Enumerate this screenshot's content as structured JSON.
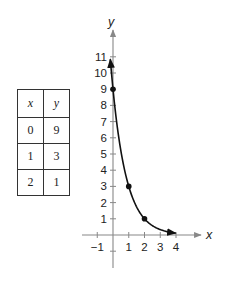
{
  "table": {
    "headers": [
      "x",
      "y"
    ],
    "rows": [
      [
        "0",
        "9"
      ],
      [
        "1",
        "3"
      ],
      [
        "2",
        "1"
      ]
    ]
  },
  "chart_data": {
    "type": "line",
    "title": "",
    "function": "y = 9(1/3)^x",
    "xlabel": "x",
    "ylabel": "y",
    "xlim": [
      -1.9,
      5.5
    ],
    "ylim": [
      -2,
      12
    ],
    "x_ticks": [
      -1,
      1,
      2,
      3,
      4
    ],
    "y_ticks": [
      1,
      2,
      3,
      4,
      5,
      6,
      7,
      8,
      9,
      10,
      11
    ],
    "grid": false,
    "points": [
      {
        "x": 0,
        "y": 9
      },
      {
        "x": 1,
        "y": 3
      },
      {
        "x": 2,
        "y": 1
      }
    ],
    "series": [
      {
        "name": "curve",
        "x": [
          -0.18,
          0,
          0.5,
          1,
          1.5,
          2,
          2.5,
          3,
          3.5,
          4
        ],
        "values": [
          11.7,
          9,
          5.2,
          3,
          1.73,
          1,
          0.58,
          0.33,
          0.19,
          0.11
        ]
      }
    ]
  },
  "colors": {
    "ink": "#222222",
    "axis": "#888888"
  }
}
